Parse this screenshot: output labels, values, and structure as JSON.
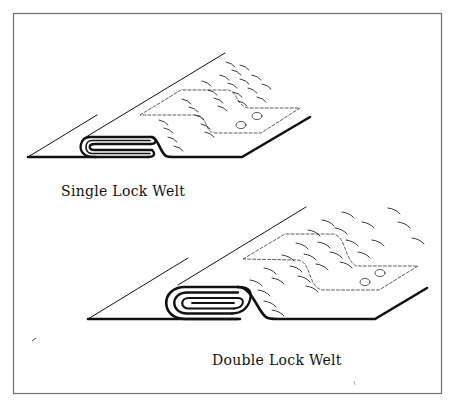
{
  "figure": {
    "frame": {
      "stroke": "#6e6e6e"
    },
    "ink_color": "#111111",
    "panels": [
      {
        "id": "single",
        "label": "Single Lock Welt",
        "fold_layers": 1,
        "dashed_outline": true,
        "circles": 2
      },
      {
        "id": "double",
        "label": "Double Lock Welt",
        "fold_layers": 2,
        "dashed_outline": true,
        "circles": 2
      }
    ]
  }
}
